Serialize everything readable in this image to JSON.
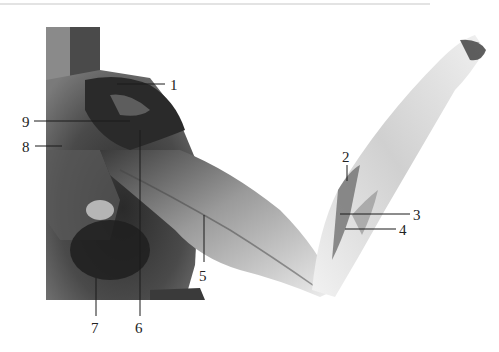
{
  "figure": {
    "type": "anatomical-dissection-photo",
    "top_rule_color": "#c8c8c8",
    "specimen_colors": {
      "dark": "#1c1c1c",
      "mid": "#6e6e6e",
      "light": "#e6e6e6",
      "background": "#ffffff"
    },
    "labels": [
      {
        "id": "1",
        "text": "1",
        "x": 172,
        "y": 91,
        "line": [
          117,
          84,
          165,
          84
        ]
      },
      {
        "id": "9",
        "text": "9",
        "x": 22,
        "y": 127,
        "line": [
          34,
          121,
          130,
          121
        ]
      },
      {
        "id": "8",
        "text": "8",
        "x": 22,
        "y": 152,
        "line": [
          35,
          146,
          62,
          146
        ]
      },
      {
        "id": "7",
        "text": "7",
        "x": 91,
        "y": 333,
        "line": [
          96,
          275,
          96,
          316
        ]
      },
      {
        "id": "6",
        "text": "6",
        "x": 135,
        "y": 333,
        "line": [
          140,
          130,
          140,
          316
        ]
      },
      {
        "id": "5",
        "text": "5",
        "x": 199,
        "y": 281,
        "line": [
          204,
          215,
          204,
          262
        ]
      },
      {
        "id": "2",
        "text": "2",
        "x": 342,
        "y": 162,
        "line": [
          347,
          165,
          347,
          181
        ]
      },
      {
        "id": "3",
        "text": "3",
        "x": 413,
        "y": 221,
        "line": [
          340,
          214,
          410,
          214
        ]
      },
      {
        "id": "4",
        "text": "4",
        "x": 399,
        "y": 235,
        "line": [
          345,
          229,
          396,
          229
        ]
      }
    ]
  }
}
